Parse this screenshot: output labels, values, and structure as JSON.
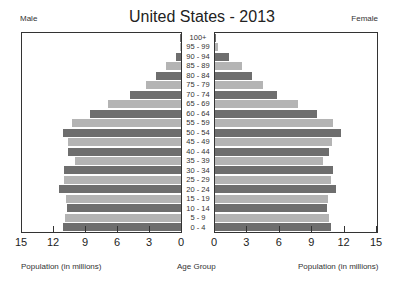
{
  "chart_data": {
    "type": "bar",
    "subtype": "population-pyramid",
    "title": "United States - 2013",
    "left_label": "Male",
    "right_label": "Female",
    "xlabel_left": "Population (in millions)",
    "xlabel_right": "Population (in millions)",
    "ylabel": "Age Group",
    "xlim": [
      0,
      15
    ],
    "x_ticks": [
      15,
      12,
      9,
      6,
      3,
      0
    ],
    "x_ticks_right": [
      0,
      3,
      6,
      9,
      12,
      15
    ],
    "grid": false,
    "colors": {
      "dark": "#6e6e6e",
      "light": "#b4b4b4"
    },
    "categories": [
      "100+",
      "95 - 99",
      "90 - 94",
      "85 - 89",
      "80 - 84",
      "75 - 79",
      "70 - 74",
      "65 - 69",
      "60 - 64",
      "55 - 59",
      "50 - 54",
      "45 - 49",
      "40 - 44",
      "35 - 39",
      "30 - 34",
      "25 - 29",
      "20 - 24",
      "15 - 19",
      "10 - 14",
      "5 - 9",
      "0 - 4"
    ],
    "series": [
      {
        "name": "Male",
        "values": [
          0.02,
          0.1,
          0.5,
          1.4,
          2.3,
          3.3,
          4.8,
          6.8,
          8.5,
          10.2,
          11.1,
          10.6,
          10.6,
          9.9,
          11.0,
          11.0,
          11.4,
          10.8,
          10.7,
          10.9,
          11.1
        ]
      },
      {
        "name": "Female",
        "values": [
          0.1,
          0.3,
          1.3,
          2.5,
          3.4,
          4.4,
          5.7,
          7.7,
          9.4,
          10.9,
          11.7,
          10.8,
          10.6,
          10.0,
          10.9,
          10.7,
          11.2,
          10.5,
          10.4,
          10.6,
          10.7
        ]
      }
    ]
  }
}
